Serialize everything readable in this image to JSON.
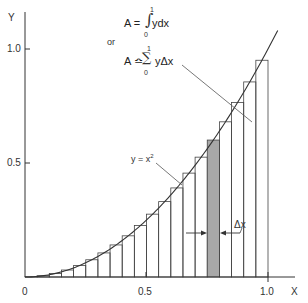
{
  "diagram": {
    "axes": {
      "x_label": "X",
      "y_label": "Y",
      "x_ticks": [
        {
          "value": 0,
          "label": "0"
        },
        {
          "value": 0.5,
          "label": "0.5"
        },
        {
          "value": 1.0,
          "label": "1.0"
        }
      ],
      "y_ticks": [
        {
          "value": 0.5,
          "label": "0.5"
        },
        {
          "value": 1.0,
          "label": "1.0"
        }
      ]
    },
    "curve": {
      "label": "y = x",
      "exponent": "2",
      "function": "x^2",
      "x_range": [
        0,
        1.04
      ]
    },
    "rectangles": {
      "count": 20,
      "delta_x": 0.05,
      "height_rule": "midpoint",
      "shaded_index": 15,
      "shaded_color": "#a8a8a8"
    },
    "delta_label": "Δx",
    "formula": {
      "line1_lhs": "A =",
      "line1_sym": "∫",
      "line1_upper": "1",
      "line1_lower": "0",
      "line1_rhs": "ydx",
      "or": "or",
      "line2_lhs": "A ≏",
      "line2_sym": "∑",
      "line2_upper": "1",
      "line2_lower": "0",
      "line2_rhs": "yΔx"
    },
    "colors": {
      "line": "#333333",
      "shaded": "#a8a8a8",
      "background": "#ffffff"
    }
  }
}
